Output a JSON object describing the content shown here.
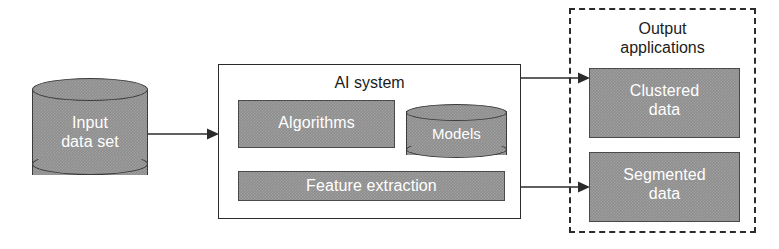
{
  "diagram": {
    "colors": {
      "fill_gray": "#8e8e8e",
      "stroke_dark": "#2b2b2b",
      "label_white": "#ffffff",
      "label_black": "#1c1c1c",
      "background": "#ffffff"
    }
  },
  "input": {
    "label_line1": "Input",
    "label_line2": "data set",
    "shape": "cylinder"
  },
  "ai_system": {
    "title": "AI system",
    "components": [
      {
        "name": "algorithms",
        "label": "Algorithms",
        "shape": "rectangle"
      },
      {
        "name": "models",
        "label": "Models",
        "shape": "cylinder"
      },
      {
        "name": "feature-extraction",
        "label": "Feature extraction",
        "shape": "rectangle"
      }
    ]
  },
  "output": {
    "title_line1": "Output",
    "title_line2": "applications",
    "border_style": "dashed",
    "items": [
      {
        "name": "clustered-data",
        "label_line1": "Clustered",
        "label_line2": "data"
      },
      {
        "name": "segmented-data",
        "label_line1": "Segmented",
        "label_line2": "data"
      }
    ]
  },
  "arrows": [
    {
      "name": "input-to-ai-system",
      "from": "input",
      "to": "ai_system"
    },
    {
      "name": "ai-system-to-clustered-data",
      "from": "ai_system",
      "to": "clustered-data"
    },
    {
      "name": "ai-system-to-segmented-data",
      "from": "ai_system",
      "to": "segmented-data"
    }
  ]
}
